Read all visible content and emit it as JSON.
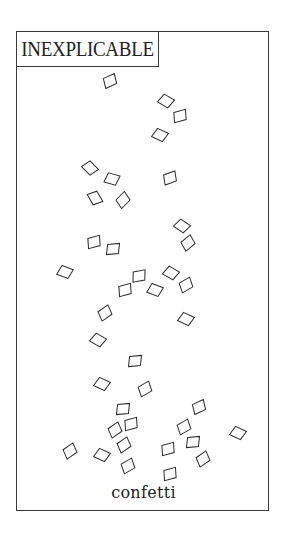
{
  "panel": {
    "title": "INEXPLICABLE",
    "caption": "confetti"
  },
  "colors": {
    "ink": "#2a2a2a",
    "paper": "#ffffff"
  },
  "confetti": [
    {
      "x": 110,
      "y": 81,
      "r": -25
    },
    {
      "x": 166,
      "y": 101,
      "r": 30
    },
    {
      "x": 180,
      "y": 116,
      "r": -15
    },
    {
      "x": 160,
      "y": 135,
      "r": 25
    },
    {
      "x": 90,
      "y": 168,
      "r": 45
    },
    {
      "x": 112,
      "y": 179,
      "r": 15
    },
    {
      "x": 170,
      "y": 178,
      "r": -20
    },
    {
      "x": 95,
      "y": 198,
      "r": 60
    },
    {
      "x": 123,
      "y": 200,
      "r": -45
    },
    {
      "x": 182,
      "y": 226,
      "r": 35
    },
    {
      "x": 188,
      "y": 243,
      "r": -40
    },
    {
      "x": 94,
      "y": 242,
      "r": -15
    },
    {
      "x": 113,
      "y": 249,
      "r": -5
    },
    {
      "x": 65,
      "y": 272,
      "r": 20
    },
    {
      "x": 139,
      "y": 276,
      "r": -10
    },
    {
      "x": 125,
      "y": 290,
      "r": -15
    },
    {
      "x": 171,
      "y": 273,
      "r": 30
    },
    {
      "x": 155,
      "y": 290,
      "r": 20
    },
    {
      "x": 186,
      "y": 285,
      "r": -30
    },
    {
      "x": 186,
      "y": 319,
      "r": 25
    },
    {
      "x": 105,
      "y": 313,
      "r": -35
    },
    {
      "x": 98,
      "y": 340,
      "r": 30
    },
    {
      "x": 135,
      "y": 361,
      "r": -5
    },
    {
      "x": 102,
      "y": 384,
      "r": 25
    },
    {
      "x": 145,
      "y": 389,
      "r": -30
    },
    {
      "x": 123,
      "y": 409,
      "r": -5
    },
    {
      "x": 199,
      "y": 407,
      "r": -25
    },
    {
      "x": 131,
      "y": 424,
      "r": -15
    },
    {
      "x": 115,
      "y": 430,
      "r": -35
    },
    {
      "x": 184,
      "y": 427,
      "r": -30
    },
    {
      "x": 238,
      "y": 433,
      "r": 25
    },
    {
      "x": 70,
      "y": 451,
      "r": -35
    },
    {
      "x": 102,
      "y": 455,
      "r": 25
    },
    {
      "x": 124,
      "y": 445,
      "r": -35
    },
    {
      "x": 168,
      "y": 449,
      "r": -15
    },
    {
      "x": 193,
      "y": 442,
      "r": -5
    },
    {
      "x": 128,
      "y": 466,
      "r": -30
    },
    {
      "x": 203,
      "y": 459,
      "r": -35
    },
    {
      "x": 170,
      "y": 474,
      "r": -15
    }
  ]
}
